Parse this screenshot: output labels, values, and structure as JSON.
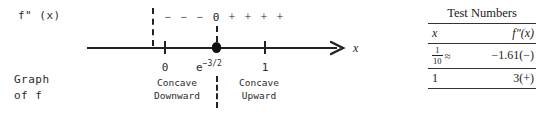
{
  "diagram": {
    "type": "sign-chart-number-line",
    "function_label": "f\" (x)",
    "graph_label_line1": "Graph",
    "graph_label_line2": "of f",
    "axis_label": "x",
    "sign_row": {
      "signs": [
        "−",
        "−",
        "−"
      ],
      "zero": "0",
      "plus_signs": [
        "+",
        "+",
        "+",
        "+"
      ]
    },
    "axis_values": {
      "left": "0",
      "middle_base": "e",
      "middle_exponent": "−3/2",
      "right": "1"
    },
    "concavity": {
      "left_line1": "Concave",
      "left_line2": "Downward",
      "right_line1": "Concave",
      "right_line2": "Upward"
    }
  },
  "test_table": {
    "title": "Test Numbers",
    "header_x": "x",
    "header_fpp": "f\"(x)",
    "rows": [
      {
        "x_num": "1",
        "x_den": "10",
        "approx": "≈",
        "value": "−1.61(−)"
      },
      {
        "x_whole": "1",
        "value": "3(+)"
      }
    ]
  }
}
